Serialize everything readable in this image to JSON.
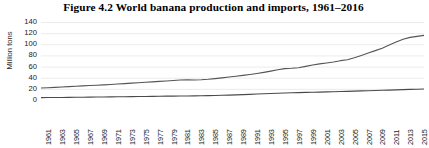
{
  "chart_data": {
    "type": "line",
    "title": "Figure 4.2  World banana production and imports, 1961–2016",
    "xlabel": "",
    "ylabel": "Million tons",
    "ylim": [
      0,
      140
    ],
    "yticks": [
      0,
      20,
      40,
      60,
      80,
      100,
      120,
      140
    ],
    "grid": true,
    "legend": "none",
    "xlim": [
      1961,
      2016
    ],
    "x": [
      1961,
      1962,
      1963,
      1964,
      1965,
      1966,
      1967,
      1968,
      1969,
      1970,
      1971,
      1972,
      1973,
      1974,
      1975,
      1976,
      1977,
      1978,
      1979,
      1980,
      1981,
      1982,
      1983,
      1984,
      1985,
      1986,
      1987,
      1988,
      1989,
      1990,
      1991,
      1992,
      1993,
      1994,
      1995,
      1996,
      1997,
      1998,
      1999,
      2000,
      2001,
      2002,
      2003,
      2004,
      2005,
      2006,
      2007,
      2008,
      2009,
      2010,
      2011,
      2012,
      2013,
      2014,
      2015,
      2016
    ],
    "xticklabels": [
      "1961",
      "1963",
      "1965",
      "1967",
      "1969",
      "1971",
      "1973",
      "1975",
      "1977",
      "1979",
      "1981",
      "1983",
      "1985",
      "1987",
      "1989",
      "1991",
      "1993",
      "1995",
      "1997",
      "1999",
      "2001",
      "2003",
      "2005",
      "2007",
      "2009",
      "2011",
      "2013",
      "2015"
    ],
    "series": [
      {
        "name": "Production",
        "color": "#555555",
        "values": [
          21.5,
          22.0,
          22.6,
          23.3,
          24.0,
          24.6,
          25.3,
          26.0,
          26.6,
          27.2,
          27.9,
          28.6,
          29.4,
          30.2,
          31.0,
          31.8,
          32.6,
          33.4,
          34.2,
          35.0,
          35.8,
          36.2,
          36.0,
          36.4,
          37.2,
          38.4,
          39.8,
          41.2,
          42.6,
          44.2,
          45.8,
          47.6,
          49.6,
          51.8,
          54.2,
          56.3,
          57.0,
          58.0,
          60.4,
          62.8,
          64.8,
          66.4,
          68.2,
          70.6,
          72.2,
          75.8,
          80.0,
          84.4,
          88.6,
          93.0,
          98.6,
          104.0,
          109.0,
          112.4,
          114.2,
          116.0
        ]
      },
      {
        "name": "Imports",
        "color": "#4a4a4a",
        "values": [
          4.2,
          4.4,
          4.5,
          4.6,
          4.8,
          4.9,
          5.0,
          5.2,
          5.3,
          5.5,
          5.6,
          5.8,
          5.9,
          6.1,
          6.2,
          6.4,
          6.5,
          6.7,
          6.9,
          7.0,
          7.2,
          7.3,
          7.4,
          7.6,
          7.8,
          8.1,
          8.4,
          8.8,
          9.2,
          9.6,
          10.1,
          10.7,
          11.2,
          11.7,
          12.2,
          12.6,
          12.9,
          13.2,
          13.6,
          13.9,
          14.2,
          14.5,
          14.8,
          15.2,
          15.5,
          15.9,
          16.3,
          16.7,
          17.0,
          17.4,
          17.8,
          18.2,
          18.6,
          19.0,
          19.4,
          19.8
        ]
      }
    ]
  }
}
